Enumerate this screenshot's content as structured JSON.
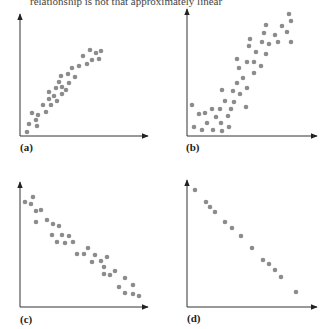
{
  "top_caption_fragment": "relationship is not that approximately linear",
  "colors": {
    "dot": "#8c8c8c",
    "axis": "#333333"
  },
  "chart_data": [
    {
      "type": "scatter",
      "label": "(a)",
      "title": "",
      "xlabel": "",
      "ylabel": "",
      "description": "Strong positive roughly linear relationship, slight curvature at top",
      "grid": false,
      "px_points": [
        [
          27,
          132
        ],
        [
          29,
          124
        ],
        [
          32,
          113
        ],
        [
          36,
          120
        ],
        [
          37,
          126
        ],
        [
          38,
          115
        ],
        [
          43,
          105
        ],
        [
          46,
          112
        ],
        [
          49,
          92
        ],
        [
          49,
          99
        ],
        [
          51,
          105
        ],
        [
          54,
          96
        ],
        [
          56,
          88
        ],
        [
          57,
          101
        ],
        [
          59,
          82
        ],
        [
          61,
          76
        ],
        [
          62,
          94
        ],
        [
          62,
          87
        ],
        [
          66,
          90
        ],
        [
          68,
          74
        ],
        [
          69,
          83
        ],
        [
          72,
          68
        ],
        [
          75,
          77
        ],
        [
          79,
          66
        ],
        [
          83,
          56
        ],
        [
          87,
          64
        ],
        [
          90,
          50
        ],
        [
          92,
          60
        ],
        [
          96,
          53
        ],
        [
          99,
          59
        ],
        [
          101,
          51
        ]
      ]
    },
    {
      "type": "scatter",
      "label": "(b)",
      "title": "",
      "xlabel": "",
      "ylabel": "",
      "description": "Positive relationship, flat at low x then rising — nonlinear, more scattered",
      "grid": false,
      "px_points": [
        [
          192,
          105
        ],
        [
          194,
          127
        ],
        [
          199,
          114
        ],
        [
          202,
          130
        ],
        [
          205,
          113
        ],
        [
          207,
          123
        ],
        [
          212,
          109
        ],
        [
          213,
          130
        ],
        [
          216,
          117
        ],
        [
          220,
          109
        ],
        [
          221,
          123
        ],
        [
          222,
          131
        ],
        [
          222,
          90
        ],
        [
          225,
          101
        ],
        [
          228,
          116
        ],
        [
          229,
          127
        ],
        [
          231,
          109
        ],
        [
          233,
          91
        ],
        [
          234,
          102
        ],
        [
          237,
          59
        ],
        [
          237,
          83
        ],
        [
          239,
          68
        ],
        [
          240,
          94
        ],
        [
          243,
          78
        ],
        [
          246,
          107
        ],
        [
          247,
          62
        ],
        [
          247,
          88
        ],
        [
          249,
          46
        ],
        [
          250,
          39
        ],
        [
          254,
          73
        ],
        [
          254,
          62
        ],
        [
          256,
          52
        ],
        [
          261,
          66
        ],
        [
          262,
          42
        ],
        [
          264,
          33
        ],
        [
          266,
          54
        ],
        [
          266,
          25
        ],
        [
          269,
          44
        ],
        [
          275,
          35
        ],
        [
          278,
          42
        ],
        [
          282,
          26
        ],
        [
          287,
          32
        ],
        [
          291,
          42
        ],
        [
          289,
          14
        ],
        [
          291,
          21
        ]
      ]
    },
    {
      "type": "scatter",
      "label": "(c)",
      "title": "",
      "xlabel": "",
      "ylabel": "",
      "description": "Strong negative linear relationship with some scatter",
      "grid": false,
      "px_points": [
        [
          25,
          202
        ],
        [
          31,
          204
        ],
        [
          33,
          197
        ],
        [
          36,
          211
        ],
        [
          36,
          222
        ],
        [
          41,
          210
        ],
        [
          47,
          220
        ],
        [
          52,
          235
        ],
        [
          53,
          224
        ],
        [
          57,
          242
        ],
        [
          59,
          226
        ],
        [
          62,
          235
        ],
        [
          65,
          243
        ],
        [
          69,
          236
        ],
        [
          73,
          242
        ],
        [
          77,
          254
        ],
        [
          84,
          254
        ],
        [
          88,
          248
        ],
        [
          92,
          262
        ],
        [
          95,
          255
        ],
        [
          101,
          261
        ],
        [
          104,
          267
        ],
        [
          104,
          274
        ],
        [
          107,
          257
        ],
        [
          110,
          275
        ],
        [
          115,
          271
        ],
        [
          119,
          287
        ],
        [
          125,
          278
        ],
        [
          125,
          293
        ],
        [
          133,
          285
        ],
        [
          133,
          294
        ],
        [
          139,
          296
        ]
      ]
    },
    {
      "type": "scatter",
      "label": "(d)",
      "title": "",
      "xlabel": "",
      "ylabel": "",
      "description": "Perfect negative linear relationship",
      "grid": false,
      "px_points": [
        [
          195,
          190
        ],
        [
          206,
          202
        ],
        [
          210,
          207
        ],
        [
          215,
          212
        ],
        [
          225,
          222
        ],
        [
          232,
          228
        ],
        [
          241,
          236
        ],
        [
          252,
          248
        ],
        [
          263,
          260
        ],
        [
          269,
          264
        ],
        [
          275,
          270
        ],
        [
          281,
          277
        ],
        [
          296,
          292
        ]
      ]
    }
  ],
  "axes": [
    {
      "label": "(a)",
      "origin": [
        20,
        136
      ],
      "y_top": 14,
      "x_right": 148,
      "label_pos": [
        20,
        141
      ]
    },
    {
      "label": "(b)",
      "origin": [
        187,
        136
      ],
      "y_top": 9,
      "x_right": 317,
      "label_pos": [
        186,
        141
      ]
    },
    {
      "label": "(c)",
      "origin": [
        20,
        307
      ],
      "y_top": 182,
      "x_right": 148,
      "label_pos": [
        20,
        313
      ]
    },
    {
      "label": "(d)",
      "origin": [
        187,
        307
      ],
      "y_top": 180,
      "x_right": 317,
      "label_pos": [
        187,
        312
      ]
    }
  ]
}
